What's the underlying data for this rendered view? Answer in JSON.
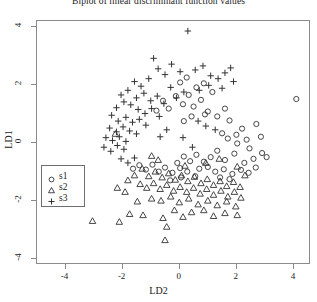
{
  "chart_data": {
    "type": "scatter",
    "title": "Biplot of linear discriminant function values",
    "xlabel": "LD2",
    "ylabel": "LD1",
    "xlim": [
      -5.0,
      4.6
    ],
    "ylim": [
      -4.2,
      4.2
    ],
    "xticks": [
      -4,
      -2,
      0,
      2,
      4
    ],
    "yticks": [
      -4,
      -2,
      0,
      2,
      4
    ],
    "xtick_labels": [
      "-4",
      "-2",
      "0",
      "2",
      "4"
    ],
    "ytick_labels": [
      "-4",
      "-2",
      "0",
      "2",
      "4"
    ],
    "grid": false,
    "legend_position": "lower-left",
    "marker_color": "#333333",
    "frame_color": "#8a8a8a",
    "series": [
      {
        "name": "s1",
        "marker": "circle",
        "points": [
          [
            4.12,
            1.48
          ],
          [
            2.72,
            0.62
          ],
          [
            2.22,
            0.46
          ],
          [
            1.78,
            0.74
          ],
          [
            1.52,
            0.3
          ],
          [
            2.05,
            -0.05
          ],
          [
            2.48,
            -0.22
          ],
          [
            2.92,
            -0.38
          ],
          [
            3.08,
            -0.52
          ],
          [
            2.62,
            -0.58
          ],
          [
            2.3,
            -0.72
          ],
          [
            1.95,
            -0.4
          ],
          [
            1.62,
            -0.62
          ],
          [
            1.35,
            -0.3
          ],
          [
            1.12,
            -0.52
          ],
          [
            0.88,
            -0.68
          ],
          [
            0.62,
            -0.44
          ],
          [
            0.4,
            -0.66
          ],
          [
            0.18,
            -0.5
          ],
          [
            -0.05,
            -0.72
          ],
          [
            0.72,
            -0.92
          ],
          [
            1.02,
            -0.86
          ],
          [
            1.28,
            -1.02
          ],
          [
            1.58,
            -0.94
          ],
          [
            1.88,
            -1.1
          ],
          [
            2.18,
            -0.96
          ],
          [
            2.45,
            -1.06
          ],
          [
            2.7,
            -0.88
          ],
          [
            0.3,
            -1.02
          ],
          [
            0.05,
            -0.9
          ],
          [
            -0.22,
            -1.06
          ],
          [
            -0.48,
            -0.88
          ],
          [
            -0.7,
            -1.02
          ],
          [
            -0.92,
            -0.78
          ],
          [
            -1.15,
            -0.95
          ],
          [
            -1.38,
            -0.8
          ],
          [
            -1.6,
            -0.92
          ],
          [
            0.52,
            1.22
          ],
          [
            0.78,
            1.45
          ],
          [
            1.02,
            1.05
          ],
          [
            0.35,
            1.62
          ],
          [
            0.62,
            1.88
          ],
          [
            0.88,
            2.02
          ],
          [
            1.18,
            1.72
          ],
          [
            0.15,
            1.3
          ],
          [
            -0.1,
            1.58
          ],
          [
            0.92,
            0.95
          ],
          [
            1.35,
            0.88
          ],
          [
            1.62,
            1.15
          ],
          [
            0.45,
            0.88
          ],
          [
            0.18,
            0.72
          ],
          [
            2.02,
            0.25
          ],
          [
            2.38,
            0.08
          ],
          [
            1.72,
            0.12
          ],
          [
            -0.35,
            1.15
          ],
          [
            -0.55,
            1.42
          ],
          [
            0.05,
            2.05
          ],
          [
            0.28,
            2.22
          ],
          [
            -0.78,
            1.08
          ],
          [
            2.88,
            0.18
          ],
          [
            1.45,
            -1.22
          ],
          [
            1.78,
            -1.28
          ],
          [
            0.58,
            -1.18
          ],
          [
            0.08,
            -1.22
          ],
          [
            -0.3,
            -1.32
          ]
        ]
      },
      {
        "name": "s2",
        "marker": "triangle",
        "points": [
          [
            -2.22,
            0.28
          ],
          [
            -1.28,
            -0.92
          ],
          [
            -1.05,
            -1.18
          ],
          [
            -0.82,
            -1.02
          ],
          [
            -0.58,
            -1.22
          ],
          [
            -0.35,
            -1.08
          ],
          [
            -0.12,
            -1.3
          ],
          [
            0.1,
            -1.15
          ],
          [
            0.32,
            -1.35
          ],
          [
            0.55,
            -1.2
          ],
          [
            0.78,
            -1.42
          ],
          [
            1.0,
            -1.28
          ],
          [
            1.22,
            -1.48
          ],
          [
            1.45,
            -1.35
          ],
          [
            1.68,
            -1.52
          ],
          [
            1.92,
            -1.38
          ],
          [
            2.15,
            -1.55
          ],
          [
            -1.55,
            -1.15
          ],
          [
            -1.78,
            -1.32
          ],
          [
            -1.35,
            -1.45
          ],
          [
            -1.12,
            -1.58
          ],
          [
            -0.88,
            -1.42
          ],
          [
            -0.65,
            -1.62
          ],
          [
            -0.42,
            -1.48
          ],
          [
            -0.18,
            -1.68
          ],
          [
            0.05,
            -1.55
          ],
          [
            0.28,
            -1.72
          ],
          [
            0.52,
            -1.58
          ],
          [
            0.75,
            -1.78
          ],
          [
            0.98,
            -1.62
          ],
          [
            1.22,
            -1.82
          ],
          [
            1.48,
            -1.68
          ],
          [
            1.72,
            -1.88
          ],
          [
            1.95,
            -1.72
          ],
          [
            2.18,
            -1.92
          ],
          [
            -0.95,
            -1.95
          ],
          [
            -0.62,
            -2.02
          ],
          [
            -0.28,
            -1.88
          ],
          [
            0.02,
            -2.08
          ],
          [
            0.35,
            -1.95
          ],
          [
            0.68,
            -2.15
          ],
          [
            1.02,
            -2.02
          ],
          [
            1.35,
            -2.18
          ],
          [
            1.68,
            -2.05
          ],
          [
            2.0,
            -2.22
          ],
          [
            -1.45,
            -2.05
          ],
          [
            -0.15,
            -2.35
          ],
          [
            0.45,
            -2.42
          ],
          [
            0.88,
            -2.35
          ],
          [
            -1.72,
            -2.48
          ],
          [
            -1.25,
            -2.52
          ],
          [
            -0.55,
            -2.62
          ],
          [
            0.15,
            -2.58
          ],
          [
            -3.02,
            -2.72
          ],
          [
            -2.08,
            -2.75
          ],
          [
            -0.42,
            -2.92
          ],
          [
            -0.48,
            -3.38
          ],
          [
            1.22,
            -2.55
          ],
          [
            1.62,
            -2.45
          ],
          [
            2.05,
            -2.52
          ],
          [
            -0.72,
            -0.62
          ],
          [
            -0.95,
            -0.48
          ],
          [
            0.22,
            -0.82
          ],
          [
            0.95,
            -0.72
          ],
          [
            1.42,
            -0.58
          ],
          [
            -1.88,
            -1.72
          ],
          [
            -2.15,
            -1.58
          ],
          [
            2.32,
            -1.15
          ],
          [
            2.05,
            -0.85
          ]
        ]
      },
      {
        "name": "s3",
        "marker": "plus",
        "points": [
          [
            0.32,
            3.82
          ],
          [
            -0.72,
            2.52
          ],
          [
            -0.48,
            2.32
          ],
          [
            -1.05,
            2.18
          ],
          [
            -0.25,
            2.68
          ],
          [
            0.05,
            2.42
          ],
          [
            0.58,
            2.48
          ],
          [
            0.85,
            2.62
          ],
          [
            1.12,
            2.28
          ],
          [
            -1.32,
            1.92
          ],
          [
            -1.55,
            2.08
          ],
          [
            -1.78,
            1.78
          ],
          [
            -2.02,
            1.62
          ],
          [
            -1.48,
            1.52
          ],
          [
            -1.22,
            1.68
          ],
          [
            -0.98,
            1.42
          ],
          [
            -0.75,
            1.58
          ],
          [
            -0.52,
            1.32
          ],
          [
            -1.68,
            1.28
          ],
          [
            -1.92,
            1.38
          ],
          [
            -2.18,
            1.18
          ],
          [
            -1.42,
            1.12
          ],
          [
            -1.18,
            0.98
          ],
          [
            -0.95,
            1.15
          ],
          [
            -0.68,
            0.88
          ],
          [
            -2.35,
            0.92
          ],
          [
            -2.12,
            0.72
          ],
          [
            -1.85,
            0.85
          ],
          [
            -1.62,
            0.68
          ],
          [
            -1.38,
            0.78
          ],
          [
            -1.15,
            0.58
          ],
          [
            -2.42,
            0.48
          ],
          [
            -2.18,
            0.35
          ],
          [
            -1.95,
            0.52
          ],
          [
            -1.72,
            0.38
          ],
          [
            -1.48,
            0.28
          ],
          [
            -2.55,
            0.15
          ],
          [
            -2.32,
            0.05
          ],
          [
            -2.08,
            0.18
          ],
          [
            -1.85,
            0.02
          ],
          [
            -2.62,
            -0.18
          ],
          [
            -2.38,
            -0.32
          ],
          [
            -2.15,
            -0.12
          ],
          [
            -1.92,
            -0.25
          ],
          [
            1.38,
            2.18
          ],
          [
            1.62,
            2.38
          ],
          [
            1.05,
            1.95
          ],
          [
            1.52,
            1.85
          ],
          [
            0.72,
            1.78
          ],
          [
            -0.28,
            1.88
          ],
          [
            -0.08,
            1.52
          ],
          [
            0.18,
            1.72
          ],
          [
            0.95,
            0.55
          ],
          [
            1.28,
            0.42
          ],
          [
            0.48,
            -0.18
          ],
          [
            0.15,
            0.15
          ],
          [
            -0.42,
            0.42
          ],
          [
            -0.65,
            0.18
          ],
          [
            -2.02,
            -0.58
          ],
          [
            -1.78,
            -0.72
          ],
          [
            -1.55,
            -0.55
          ],
          [
            0.68,
            0.72
          ],
          [
            1.82,
            2.55
          ],
          [
            1.92,
            2.08
          ],
          [
            -0.88,
            2.88
          ]
        ]
      }
    ]
  },
  "legend": {
    "entries": [
      {
        "label": "s1",
        "marker": "circle"
      },
      {
        "label": "s2",
        "marker": "triangle"
      },
      {
        "label": "s3",
        "marker": "plus"
      }
    ]
  }
}
